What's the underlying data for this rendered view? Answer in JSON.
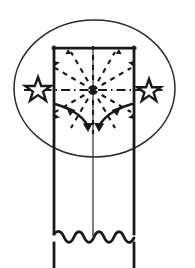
{
  "figure": {
    "canvas": {
      "width": 195,
      "height": 268
    },
    "colors": {
      "background": "#ffffff",
      "stroke": "#1a1a1a",
      "thin_stroke": "#2b2b2b",
      "fill": "none"
    },
    "stroke_widths": {
      "member_outline": 2.6,
      "ellipse": 1.4,
      "centerline": 1.2,
      "dashed_ray": 2.0,
      "arrow": 2.4,
      "break_line": 2.6
    }
  },
  "elements": {
    "member": {
      "name": "rectangular member",
      "left_x": 54,
      "right_x": 134,
      "top_y": 47,
      "bottom_y": 268,
      "break_y": 238
    },
    "ellipse": {
      "name": "detail boundary ellipse",
      "cx": 94.5,
      "cy": 88.5,
      "rx": 80.5,
      "ry": 68.5
    },
    "center_point": {
      "name": "radiation origin",
      "cx": 93,
      "cy": 90
    },
    "centerline": {
      "name": "vertical center line",
      "x": 93,
      "y1": 47,
      "y2": 238
    },
    "horizontal_axis": {
      "name": "dash-dot horizontal axis",
      "y": 90,
      "x1": 24,
      "x2": 163,
      "dash_pattern": "9 4 1 4"
    },
    "stars": [
      {
        "name": "left star marker",
        "cx": 38,
        "cy": 90,
        "outer_r": 13,
        "inner_r": 5.4
      },
      {
        "name": "right star marker",
        "cx": 149,
        "cy": 90,
        "outer_r": 12,
        "inner_r": 5.0
      }
    ],
    "radial_rays": {
      "name": "dashed radial rays",
      "count": 12,
      "dash_pattern": "5 5",
      "angles_deg": [
        0,
        30,
        60,
        90,
        120,
        150,
        180,
        210,
        240,
        270,
        300,
        330
      ],
      "length": 46
    },
    "curved_arrows": [
      {
        "name": "left curved flow arrow",
        "path": "M 56 105 C 66 108, 80 114, 87 126",
        "tip": {
          "x": 88,
          "y": 129
        },
        "mid_arrow": {
          "x": 72,
          "y": 112
        }
      },
      {
        "name": "right curved flow arrow",
        "path": "M 131 105 C 121 108, 107 114, 100 126",
        "tip": {
          "x": 99,
          "y": 129
        },
        "mid_arrow": {
          "x": 116,
          "y": 112
        }
      }
    ],
    "break_line": {
      "name": "wavy break line",
      "y": 238,
      "x1": 54,
      "x2": 134,
      "waves": 4,
      "amplitude": 7
    }
  },
  "labels": {
    "visible_text": []
  }
}
